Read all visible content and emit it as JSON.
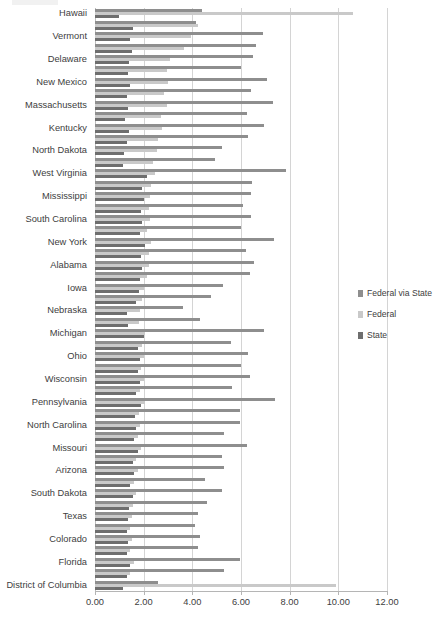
{
  "chart_data": {
    "type": "bar",
    "orientation": "horizontal",
    "title": "",
    "subtitle": "",
    "xlabel": "",
    "ylabel": "",
    "xlim": [
      0,
      12
    ],
    "xticks": [
      0,
      2,
      4,
      6,
      8,
      10,
      12
    ],
    "xtick_labels": [
      "0.00",
      "2.00",
      "4.00",
      "6.00",
      "8.00",
      "10.00",
      "12.00"
    ],
    "grid": true,
    "legend_position": "right",
    "series_order_top_to_bottom": [
      "Federal via State",
      "Federal",
      "State"
    ],
    "colors": {
      "Federal via State": "#8e8e8e",
      "Federal": "#c9c9c9",
      "State": "#6e6e6e",
      "gridline": "#d4d4d4",
      "axis": "#b5b5b5",
      "text": "#404040"
    },
    "categories": [
      "Hawaii",
      "Alaska",
      "Vermont",
      "Wyoming",
      "Delaware",
      "Rhode Island",
      "New Mexico",
      "Maine",
      "Massachusetts",
      "Montana",
      "Kentucky",
      "Connecticut",
      "North Dakota",
      "Oregon",
      "West Virginia",
      "Louisiana",
      "Mississippi",
      "Arkansas",
      "South Carolina",
      "Tennessee",
      "New York",
      "Minnesota",
      "Alabama",
      "Maryland",
      "Iowa",
      "Kansas",
      "Nebraska",
      "Utah",
      "Michigan",
      "Indiana",
      "Ohio",
      "Oklahoma",
      "Wisconsin",
      "Virginia",
      "Pennsylvania",
      "Washington",
      "North Carolina",
      "Georgia",
      "Missouri",
      "Illinois",
      "Arizona",
      "Nevada",
      "South Dakota",
      "Idaho",
      "Texas",
      "New Hampshire",
      "Colorado",
      "New Jersey",
      "Florida",
      "California",
      "District of Columbia"
    ],
    "visible_category_labels": [
      "Hawaii",
      "Vermont",
      "Delaware",
      "New Mexico",
      "Massachusetts",
      "Kentucky",
      "North Dakota",
      "West Virginia",
      "Mississippi",
      "South Carolina",
      "New York",
      "Alabama",
      "Iowa",
      "Nebraska",
      "Michigan",
      "Ohio",
      "Wisconsin",
      "Pennsylvania",
      "North Carolina",
      "Missouri",
      "Arizona",
      "South Dakota",
      "Texas",
      "Colorado",
      "Florida",
      "District of Columbia"
    ],
    "series": [
      {
        "name": "Federal via State",
        "color": "#8e8e8e",
        "values": [
          4.4,
          4.15,
          6.9,
          6.6,
          6.5,
          6.0,
          7.05,
          6.4,
          7.3,
          6.25,
          6.95,
          6.3,
          5.2,
          4.95,
          7.85,
          6.45,
          6.4,
          6.1,
          6.4,
          6.0,
          7.35,
          6.2,
          6.55,
          6.35,
          5.25,
          4.75,
          3.6,
          4.3,
          6.95,
          5.6,
          6.3,
          6.0,
          6.35,
          5.65,
          7.4,
          5.95,
          5.95,
          5.3,
          6.25,
          5.2,
          5.3,
          4.5,
          5.2,
          4.6,
          4.25,
          4.1,
          4.3,
          4.25,
          5.95,
          5.3,
          2.6
        ]
      },
      {
        "name": "Federal",
        "color": "#c9c9c9",
        "values": [
          10.6,
          4.25,
          3.95,
          3.65,
          3.1,
          2.95,
          3.0,
          2.85,
          2.95,
          2.7,
          2.75,
          2.6,
          2.55,
          2.4,
          2.45,
          2.3,
          2.25,
          2.2,
          2.25,
          2.15,
          2.3,
          2.2,
          2.2,
          2.15,
          2.0,
          1.95,
          1.85,
          1.8,
          2.05,
          1.95,
          2.0,
          1.9,
          2.0,
          1.85,
          2.05,
          1.8,
          1.85,
          1.75,
          1.9,
          1.7,
          1.75,
          1.6,
          1.7,
          1.55,
          1.5,
          1.45,
          1.5,
          1.45,
          1.6,
          1.45,
          9.9
        ]
      },
      {
        "name": "State",
        "color": "#6e6e6e",
        "values": [
          1.0,
          1.55,
          1.45,
          1.5,
          1.4,
          1.35,
          1.45,
          1.3,
          1.35,
          1.25,
          1.4,
          1.3,
          1.2,
          1.15,
          2.15,
          1.95,
          2.0,
          1.9,
          1.95,
          1.85,
          2.05,
          1.9,
          1.95,
          1.85,
          1.8,
          1.7,
          1.3,
          1.35,
          2.0,
          1.75,
          1.85,
          1.75,
          1.85,
          1.7,
          1.9,
          1.65,
          1.7,
          1.6,
          1.75,
          1.55,
          1.6,
          1.45,
          1.55,
          1.4,
          1.35,
          1.3,
          1.35,
          1.3,
          1.45,
          1.3,
          1.15
        ]
      }
    ]
  },
  "legend": {
    "items": [
      {
        "label": "Federal via State",
        "swatch": "s-fvs"
      },
      {
        "label": "Federal",
        "swatch": "s-fed"
      },
      {
        "label": "State",
        "swatch": "s-state"
      }
    ]
  }
}
